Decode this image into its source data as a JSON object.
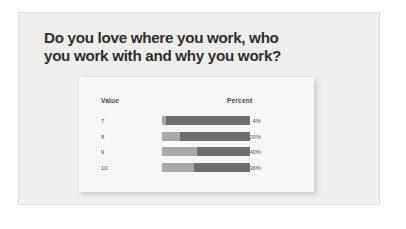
{
  "slide": {
    "title": "Do you love where you work,  who\nyou work with and why you work?"
  },
  "chart_data": {
    "type": "bar",
    "title": "",
    "xlabel": "",
    "ylabel": "",
    "orientation": "horizontal",
    "columns": [
      "Value",
      "Percent"
    ],
    "categories": [
      "7",
      "8",
      "9",
      "10"
    ],
    "values": [
      4,
      20,
      40,
      36
    ],
    "value_labels": [
      "4%",
      "20%",
      "40%",
      "36%"
    ],
    "xlim": [
      0,
      100
    ],
    "grid": false,
    "legend": "none",
    "colors": {
      "bar_fill": "#a8a8a8",
      "bar_track": "#6e6e6e",
      "card_background": "#f7f7f6",
      "slide_background": "#eeeeec",
      "title_text": "#2e2e2e",
      "label_text": "#5a5a5a"
    },
    "rows": [
      {
        "value": "7",
        "percent": "4%",
        "percent_number": 4
      },
      {
        "value": "8",
        "percent": "20%",
        "percent_number": 20
      },
      {
        "value": "9",
        "percent": "40%",
        "percent_number": 40
      },
      {
        "value": "10",
        "percent": "36%",
        "percent_number": 36
      }
    ]
  }
}
